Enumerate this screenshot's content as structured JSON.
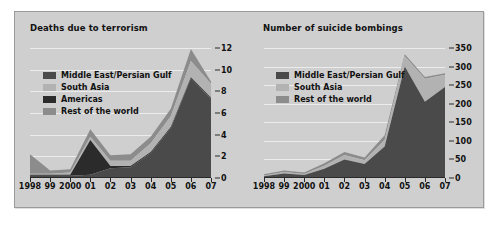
{
  "page": {
    "background": "#ffffff",
    "panel_background": "#cfcfcf",
    "panel_border": "#9a9a9a"
  },
  "palette": {
    "middle_east": "#4a4a4a",
    "south_asia": "#b2b2b2",
    "americas": "#2b2b2b",
    "rest_of_world": "#8c8c8c",
    "gridline": "#ececec",
    "axis": "#2a2a2a",
    "text": "#111111"
  },
  "charts": [
    {
      "id": "deaths-due-to-terrorism",
      "title": "Deaths due to terrorism",
      "legend": [
        {
          "label": "Middle East/Persian Gulf",
          "color": "#4a4a4a"
        },
        {
          "label": "South Asia",
          "color": "#b2b2b2"
        },
        {
          "label": "Americas",
          "color": "#2b2b2b"
        },
        {
          "label": "Rest of the world",
          "color": "#8c8c8c"
        }
      ]
    },
    {
      "id": "number-of-suicide-bombings",
      "title": "Number of suicide bombings",
      "legend": [
        {
          "label": "Middle East/Persian Gulf",
          "color": "#4a4a4a"
        },
        {
          "label": "South Asia",
          "color": "#b2b2b2"
        },
        {
          "label": "Rest of the world",
          "color": "#8c8c8c"
        }
      ]
    }
  ],
  "chart_data": [
    {
      "type": "area",
      "id": "deaths-due-to-terrorism",
      "title": "Deaths due to terrorism",
      "stacked": true,
      "xlabel": "",
      "ylabel": "",
      "categories": [
        "1998",
        "99",
        "2000",
        "01",
        "02",
        "03",
        "04",
        "05",
        "06",
        "07"
      ],
      "x": [
        1998,
        1999,
        2000,
        2001,
        2002,
        2003,
        2004,
        2005,
        2006,
        2007
      ],
      "ylim": [
        0,
        12
      ],
      "yticks": [
        0,
        2,
        4,
        6,
        8,
        10,
        12
      ],
      "grid": true,
      "legend_position": "inside-top-left",
      "series": [
        {
          "name": "Middle East/Persian Gulf",
          "color": "#4a4a4a",
          "values": [
            0.2,
            0.2,
            0.2,
            0.3,
            0.9,
            1.0,
            2.3,
            4.6,
            9.2,
            7.3
          ]
        },
        {
          "name": "South Asia",
          "color": "#b2b2b2",
          "values": [
            0.1,
            0.1,
            0.2,
            0.3,
            0.5,
            0.5,
            0.8,
            1.0,
            1.5,
            1.3
          ]
        },
        {
          "name": "Americas",
          "color": "#2b2b2b",
          "values": [
            0.1,
            0.1,
            0.1,
            3.2,
            0.2,
            0.1,
            0.1,
            0.1,
            0.1,
            0.1
          ]
        },
        {
          "name": "Rest of the world",
          "color": "#8c8c8c",
          "values": [
            1.8,
            0.3,
            0.3,
            0.7,
            0.5,
            0.6,
            0.6,
            0.7,
            1.1,
            0.2
          ]
        }
      ],
      "series_order_bottom_to_top": [
        "Middle East/Persian Gulf",
        "Americas",
        "South Asia",
        "Rest of the world"
      ],
      "totals": [
        2.2,
        0.7,
        0.8,
        4.5,
        2.1,
        2.2,
        3.8,
        6.4,
        11.9,
        8.9
      ]
    },
    {
      "type": "area",
      "id": "number-of-suicide-bombings",
      "title": "Number of suicide bombings",
      "stacked": true,
      "xlabel": "",
      "ylabel": "",
      "categories": [
        "1998",
        "99",
        "2000",
        "01",
        "02",
        "03",
        "04",
        "05",
        "06",
        "07"
      ],
      "x": [
        1998,
        1999,
        2000,
        2001,
        2002,
        2003,
        2004,
        2005,
        2006,
        2007
      ],
      "ylim": [
        0,
        350
      ],
      "yticks": [
        0,
        50,
        100,
        150,
        200,
        250,
        300,
        350
      ],
      "grid": true,
      "legend_position": "inside-top-left",
      "series": [
        {
          "name": "Middle East/Persian Gulf",
          "color": "#4a4a4a",
          "values": [
            5,
            12,
            8,
            25,
            50,
            38,
            85,
            300,
            205,
            245
          ]
        },
        {
          "name": "South Asia",
          "color": "#b2b2b2",
          "values": [
            2,
            4,
            3,
            8,
            12,
            10,
            18,
            28,
            62,
            33
          ]
        },
        {
          "name": "Rest of the world",
          "color": "#8c8c8c",
          "values": [
            3,
            4,
            4,
            7,
            8,
            7,
            12,
            5,
            5,
            4
          ]
        }
      ],
      "series_order_bottom_to_top": [
        "Middle East/Persian Gulf",
        "South Asia",
        "Rest of the world"
      ],
      "totals": [
        10,
        20,
        15,
        40,
        70,
        55,
        115,
        333,
        272,
        282
      ]
    }
  ]
}
